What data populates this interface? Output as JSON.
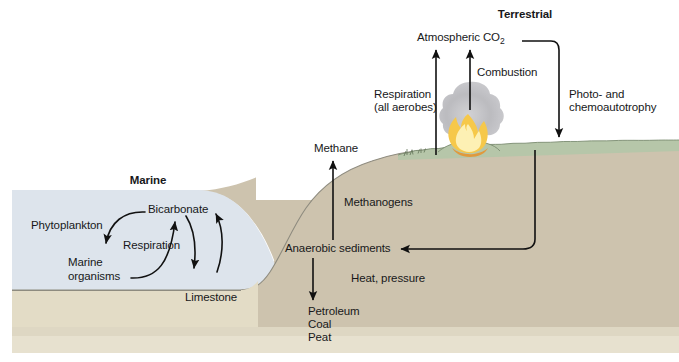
{
  "figure": {
    "title_marine": "Marine",
    "title_terrestrial": "Terrestrial"
  },
  "colors": {
    "ocean": "#dde4ec",
    "seafloor": "#e3dcc6",
    "land": "#cdc3ae",
    "grass": "#b6c6a9",
    "bottom_band": "#e7e1cf",
    "stroke": "#111111",
    "flame_outer": "#f2b23c",
    "flame_inner": "#fbe08a",
    "smoke": "#b9b9bb"
  },
  "labels": {
    "phytoplankton": "Phytoplankton",
    "bicarbonate": "Bicarbonate",
    "respiration_marine": "Respiration",
    "marine_organisms_line1": "Marine",
    "marine_organisms_line2": "organisms",
    "limestone": "Limestone",
    "methane": "Methane",
    "methanogens": "Methanogens",
    "anaerobic_sediments": "Anaerobic sediments",
    "heat_pressure": "Heat, pressure",
    "petroleum": "Petroleum",
    "coal": "Coal",
    "peat": "Peat",
    "atmospheric_co2_text": "Atmospheric CO",
    "atmospheric_co2_sub": "2",
    "respiration_terrestrial_line1": "Respiration",
    "respiration_terrestrial_line2": "(all aerobes)",
    "combustion": "Combustion",
    "photo_chemo_line1": "Photo- and",
    "photo_chemo_line2": "chemoautotrophy"
  },
  "icons": {
    "fire": "fire-icon",
    "smoke": "smoke-plume-icon",
    "grass": "grass-tuft-icon"
  }
}
